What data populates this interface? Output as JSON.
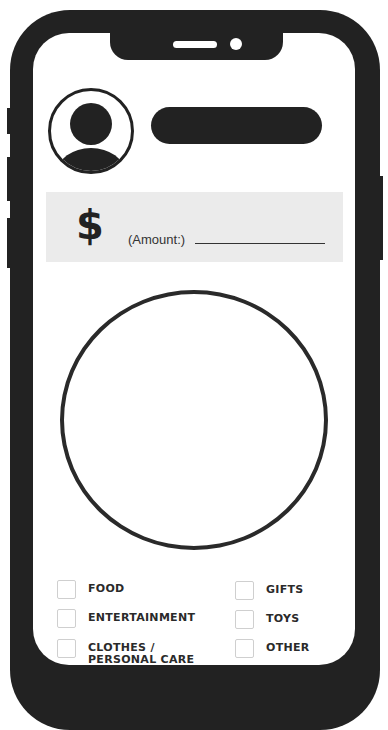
{
  "header": {
    "avatar_icon": "user-avatar-icon",
    "name_placeholder": ""
  },
  "amount": {
    "currency_symbol": "$",
    "label": "(Amount:)",
    "value": ""
  },
  "chart": {
    "placeholder": "empty-pie-circle"
  },
  "categories": {
    "left": [
      {
        "label": "FOOD",
        "checked": false
      },
      {
        "label": "ENTERTAINMENT",
        "checked": false
      },
      {
        "label": "CLOTHES / PERSONAL CARE",
        "checked": false
      }
    ],
    "right": [
      {
        "label": "GIFTS",
        "checked": false
      },
      {
        "label": "TOYS",
        "checked": false
      },
      {
        "label": "OTHER",
        "checked": false
      }
    ]
  },
  "colors": {
    "frame": "#222222",
    "amount_bg": "#ebebeb",
    "screen": "#ffffff"
  }
}
